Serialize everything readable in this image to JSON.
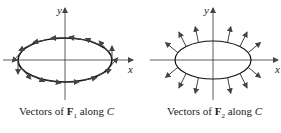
{
  "panels": [
    {
      "id": "F1",
      "caption_prefix": "Vectors of ",
      "caption_vector": "F",
      "caption_sub": "1",
      "caption_suffix": " along ",
      "caption_curve": "C",
      "x_axis_label": "x",
      "y_axis_label": "y",
      "description": "Tangential vector field along ellipse C (counterclockwise)"
    },
    {
      "id": "F2",
      "caption_prefix": "Vectors of ",
      "caption_vector": "F",
      "caption_sub": "2",
      "caption_suffix": " along ",
      "caption_curve": "C",
      "x_axis_label": "x",
      "y_axis_label": "y",
      "description": "Normal (outward) vector field along ellipse C"
    }
  ]
}
